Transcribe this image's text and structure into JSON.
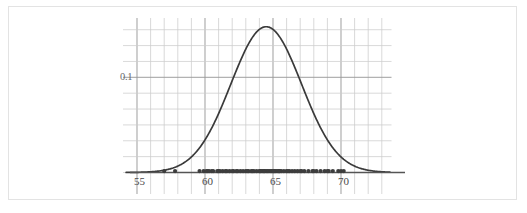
{
  "figure": {
    "title": "",
    "background_color": "#ffffff",
    "border_color": "#e3e3e3",
    "curve_color": "#3a3a3a",
    "axis_color": "#555555",
    "grid_color_major": "#999999",
    "grid_color_minor": "#cccccc",
    "dot_color": "#3d3d3d",
    "label_color": "#4a4a4a"
  },
  "chart_data": {
    "type": "line",
    "title": "",
    "subtitle": "",
    "xlabel": "",
    "ylabel": "",
    "xlim": [
      54.0,
      73.0
    ],
    "ylim": [
      0.0,
      0.145
    ],
    "grid": true,
    "legend": null,
    "x_ticks": [
      55,
      60,
      65,
      70
    ],
    "x_tick_labels": [
      "55",
      "60",
      "65",
      "70"
    ],
    "x_minor_step": 1,
    "y_ticks": [
      0.1
    ],
    "y_tick_labels": [
      "0.1"
    ],
    "y_minor_step": 0.0167,
    "annotations": [],
    "series": [
      {
        "name": "normal density curve",
        "type": "line",
        "distribution": "normal",
        "mean": 64.5,
        "sd": 2.6,
        "peak_x": 64.5,
        "peak_y": 0.1405,
        "x": [
          54.0,
          55.0,
          56.0,
          57.0,
          58.0,
          59.0,
          60.0,
          61.0,
          62.0,
          63.0,
          64.0,
          64.5,
          65.0,
          66.0,
          67.0,
          68.0,
          69.0,
          70.0,
          71.0,
          72.0,
          73.0
        ],
        "y": [
          0.0003,
          0.0013,
          0.0045,
          0.0126,
          0.0291,
          0.0555,
          0.0874,
          0.1134,
          0.1297,
          0.1373,
          0.1375,
          0.1405,
          0.1375,
          0.1208,
          0.0971,
          0.0675,
          0.0399,
          0.02,
          0.0085,
          0.003,
          0.0009
        ]
      },
      {
        "name": "observed values (rug / dot plot)",
        "type": "scatter",
        "y_value": 0.0,
        "count": 72,
        "values": [
          57.0,
          57.8,
          59.6,
          59.9,
          60.2,
          60.5,
          60.6,
          60.9,
          61.1,
          61.3,
          61.6,
          61.8,
          62.1,
          62.4,
          62.6,
          62.8,
          63.0,
          63.2,
          63.4,
          63.6,
          63.8,
          64.0,
          64.1,
          64.2,
          64.3,
          64.4,
          64.5,
          64.6,
          64.7,
          64.8,
          64.9,
          65.0,
          65.1,
          65.2,
          65.3,
          65.4,
          65.5,
          65.6,
          65.8,
          66.0,
          66.2,
          66.4,
          66.6,
          66.8,
          67.0,
          67.3,
          67.6,
          67.9,
          68.2,
          68.5,
          68.8,
          69.1,
          69.4,
          69.8,
          70.0,
          70.2,
          60.1,
          60.3,
          61.0,
          61.5,
          62.0,
          62.3,
          63.1,
          63.5,
          64.05,
          64.35,
          65.05,
          65.45,
          66.1,
          67.1,
          68.0,
          69.0
        ]
      }
    ]
  }
}
